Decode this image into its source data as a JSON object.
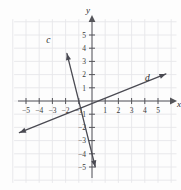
{
  "chart_data": {
    "type": "line",
    "title": "",
    "xlabel": "x",
    "ylabel": "y",
    "xlim": [
      -5.7,
      5.9
    ],
    "ylim": [
      -5.9,
      5.9
    ],
    "grid": true,
    "grid_step": 1,
    "legend": "none",
    "axis_color": "#55555a",
    "grid_color": "#e6e6ea",
    "line_color": "#4a4a52",
    "background": "#fdfdfd",
    "xticks": [
      -5,
      -4,
      -3,
      -2,
      -1,
      1,
      2,
      3,
      4,
      5
    ],
    "yticks": [
      -5,
      -4,
      -3,
      -2,
      -1,
      1,
      2,
      3,
      4,
      5
    ],
    "xtick_labels": [
      "−5",
      "−4",
      "−3",
      "−2",
      "−1",
      "1",
      "2",
      "3",
      "4",
      "5"
    ],
    "ytick_labels": [
      "−5",
      "−4",
      "−3",
      "−2",
      "−1",
      "1",
      "2",
      "3",
      "4",
      "5"
    ],
    "series": [
      {
        "name": "c",
        "label": "c",
        "slope": -4.0,
        "intercept": -4.0,
        "x_intercept": -1.0,
        "y_intercept": -4.0,
        "endpoints": [
          [
            -1.9,
            3.6
          ],
          [
            0.25,
            -5.0
          ]
        ],
        "label_pos": [
          -3.3,
          4.4
        ],
        "arrows": "both"
      },
      {
        "name": "d",
        "label": "d",
        "slope": 0.4,
        "intercept": -0.2,
        "x_intercept": 0.5,
        "y_intercept": -0.2,
        "endpoints": [
          [
            -5.5,
            -2.4
          ],
          [
            5.6,
            2.05
          ]
        ],
        "label_pos": [
          4.2,
          1.55
        ],
        "arrows": "both"
      }
    ]
  },
  "axes": {
    "x_axis_label": "x",
    "y_axis_label": "y"
  }
}
